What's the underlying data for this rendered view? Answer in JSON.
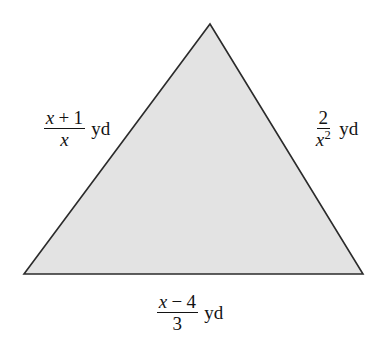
{
  "figure": {
    "name": "shaded-triangle-with-rational-side-lengths",
    "background_color": "#ffffff",
    "shape": {
      "type": "triangle",
      "fill_color": "#e3e3e3",
      "stroke_color": "#2b2b2b",
      "stroke_width": 1.6,
      "vertices": [
        {
          "label": "apex",
          "x": 210,
          "y": 24
        },
        {
          "label": "bottom-right",
          "x": 363,
          "y": 274
        },
        {
          "label": "bottom-left",
          "x": 24,
          "y": 274
        }
      ]
    },
    "labels": {
      "left": {
        "numerator_var": "x",
        "numerator_operator": "+",
        "numerator_constant": "1",
        "denominator": "x",
        "unit": "yd",
        "text": "(x + 1)/x yd"
      },
      "right": {
        "numerator": "2",
        "denominator_var": "x",
        "denominator_exponent": "2",
        "unit": "yd",
        "text": "2/x^2 yd"
      },
      "bottom": {
        "numerator_var": "x",
        "numerator_operator": "−",
        "numerator_constant": "4",
        "denominator": "3",
        "unit": "yd",
        "text": "(x - 4)/3 yd"
      }
    }
  }
}
